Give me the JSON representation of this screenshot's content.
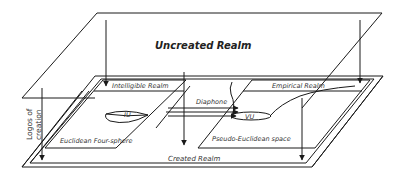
{
  "diagram": {
    "top_plane": {
      "label": "Uncreated Realm"
    },
    "bottom_plane": {
      "label": "Created Realm"
    },
    "left_region": {
      "upper_label": "Intelligible Realm",
      "lower_label": "Euclidean Four-sphere",
      "shape_label": "IU"
    },
    "right_region": {
      "upper_label": "Empirical Realm",
      "lower_label": "Pseudo-Euclidean space",
      "shape_label": "VU"
    },
    "connector": {
      "label": "Diaphone"
    },
    "side_arrow": {
      "label_line1": "Logos of",
      "label_line2": "creation"
    },
    "colors": {
      "line": "#1a1a1a",
      "text": "#333333",
      "background": "#ffffff"
    }
  }
}
